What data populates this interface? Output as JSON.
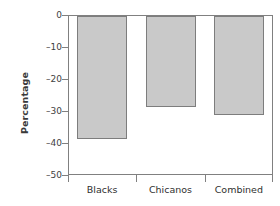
{
  "chart_data": {
    "type": "bar",
    "title": "",
    "xlabel": "",
    "ylabel": "Percentage",
    "categories": [
      "Blacks",
      "Chicanos",
      "Combined"
    ],
    "values": [
      -38.5,
      -28.5,
      -31.0
    ],
    "ylim": [
      -50,
      0
    ],
    "yticks": [
      0,
      -10,
      -20,
      -30,
      -40,
      -50
    ],
    "ytick_labels": [
      "0",
      "–10",
      "–20",
      "–30",
      "–40",
      "–50"
    ],
    "grid": false,
    "legend": null,
    "bar_fill_color": "#c9c9c9",
    "bar_edge_color": "#7d7d7d",
    "axis_color": "#808080",
    "background_color": "#ffffff",
    "orientation": "vertical",
    "baseline": 0
  }
}
